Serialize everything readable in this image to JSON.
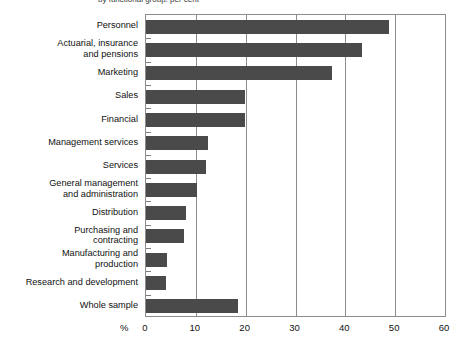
{
  "figure": {
    "cropped_heading": "by functional group: per cent"
  },
  "axis": {
    "unit_label": "%",
    "ticks": [
      "0",
      "10",
      "20",
      "30",
      "40",
      "50",
      "60"
    ]
  },
  "colors": {
    "bar": "#4a4a4a",
    "axis": "#8c8c8c",
    "background": "#ffffff",
    "text": "#111111"
  },
  "chart_data": {
    "type": "bar",
    "orientation": "horizontal",
    "title": "",
    "xlabel": "%",
    "ylabel": "",
    "xlim": [
      0,
      60
    ],
    "xticks": [
      0,
      10,
      20,
      30,
      40,
      50,
      60
    ],
    "grid": true,
    "legend": false,
    "categories": [
      "Personnel",
      "Actuarial, insurance and pensions",
      "Marketing",
      "Sales",
      "Financial",
      "Management services",
      "Services",
      "General management and administration",
      "Distribution",
      "Purchasing and contracting",
      "Manufacturing and production",
      "Research and development",
      "Whole sample"
    ],
    "category_lines": [
      [
        "Personnel"
      ],
      [
        "Actuarial, insurance",
        "and pensions"
      ],
      [
        "Marketing"
      ],
      [
        "Sales"
      ],
      [
        "Financial"
      ],
      [
        "Management services"
      ],
      [
        "Services"
      ],
      [
        "General management",
        "and administration"
      ],
      [
        "Distribution"
      ],
      [
        "Purchasing and",
        "contracting"
      ],
      [
        "Manufacturing and",
        "production"
      ],
      [
        "Research and development"
      ],
      [
        "Whole sample"
      ]
    ],
    "values": [
      48.7,
      43.4,
      37.4,
      19.9,
      19.9,
      12.5,
      12.1,
      10.2,
      8.0,
      7.6,
      4.2,
      4.0,
      18.5
    ]
  }
}
